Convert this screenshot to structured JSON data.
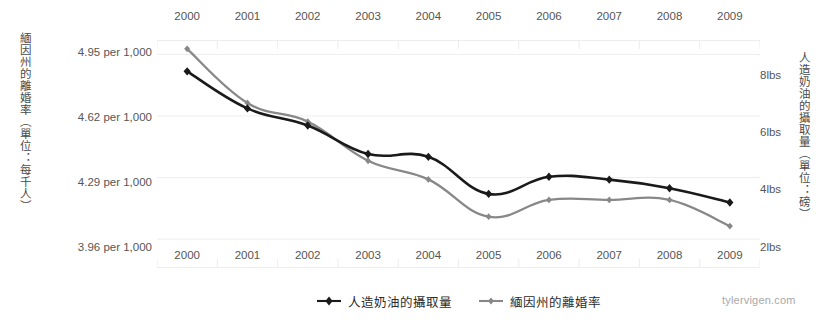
{
  "chart_data": {
    "type": "line",
    "title": "",
    "subtitle": "",
    "categories": [
      "2000",
      "2001",
      "2002",
      "2003",
      "2004",
      "2005",
      "2006",
      "2007",
      "2008",
      "2009"
    ],
    "x": [
      2000,
      2001,
      2002,
      2003,
      2004,
      2005,
      2006,
      2007,
      2008,
      2009
    ],
    "xlabel": "",
    "grid": true,
    "legend_position": "bottom-center",
    "series": [
      {
        "name": "人造奶油的攝取量",
        "axis": "right",
        "color": "#1a1a1a",
        "marker": "diamond",
        "unit": "lbs",
        "values": [
          8.2,
          6.9,
          6.3,
          5.3,
          5.2,
          3.9,
          4.5,
          4.4,
          4.1,
          3.6
        ]
      },
      {
        "name": "緬因州的離婚率",
        "axis": "left",
        "color": "#888888",
        "marker": "diamond",
        "unit": "per 1,000",
        "values": [
          4.98,
          4.69,
          4.59,
          4.38,
          4.28,
          4.08,
          4.17,
          4.17,
          4.17,
          4.03
        ]
      }
    ],
    "left_axis": {
      "label": "緬因州的離婚率（單位：每千人）",
      "ticks": [
        4.95,
        4.62,
        4.29,
        3.96
      ],
      "tick_labels": [
        "4.95 per 1,000",
        "4.62 per 1,000",
        "4.29 per 1,000",
        "3.96 per 1,000"
      ],
      "ylim": [
        3.805,
        5.0275
      ]
    },
    "right_axis": {
      "label": "人造奶油的攝取量（單位：磅）",
      "ticks": [
        8,
        6,
        4,
        2
      ],
      "tick_labels": [
        "8lbs",
        "6lbs",
        "4lbs",
        "2lbs"
      ],
      "ylim": [
        1.3,
        9.3
      ]
    }
  },
  "axes": {
    "left_title": "緬因州的離婚率（單位：每千人）",
    "right_title": "人造奶油的攝取量（單位：磅）",
    "left_tick_labels": [
      "4.95 per 1,000",
      "4.62 per 1,000",
      "4.29 per 1,000",
      "3.96 per 1,000"
    ],
    "right_tick_labels": [
      "8lbs",
      "6lbs",
      "4lbs",
      "2lbs"
    ],
    "x_tick_labels_top": [
      "2000",
      "2001",
      "2002",
      "2003",
      "2004",
      "2005",
      "2006",
      "2007",
      "2008",
      "2009"
    ],
    "x_tick_labels_bottom": [
      "2000",
      "2001",
      "2002",
      "2003",
      "2004",
      "2005",
      "2006",
      "2007",
      "2008",
      "2009"
    ]
  },
  "legend": {
    "items": [
      {
        "label": "人造奶油的攝取量",
        "color": "#1a1a1a"
      },
      {
        "label": "緬因州的離婚率",
        "color": "#888888"
      }
    ]
  },
  "watermark": {
    "text": "tylervigen.com"
  },
  "colors": {
    "series_black": "#1a1a1a",
    "series_gray": "#888888",
    "gridline": "#ededed",
    "text": "#555555",
    "watermark": "#a8a8a8",
    "background": "#ffffff"
  }
}
